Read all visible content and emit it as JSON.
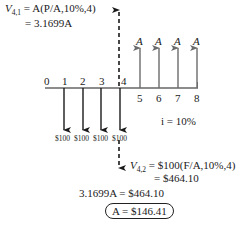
{
  "diagram": {
    "type": "cash-flow-diagram",
    "interest_rate_label": "i = 10%",
    "timeline": {
      "ticks": [
        "0",
        "1",
        "2",
        "3",
        "4",
        "5",
        "6",
        "7",
        "8"
      ]
    },
    "outflows": [
      {
        "period": "1",
        "label": "$100"
      },
      {
        "period": "2",
        "label": "$100"
      },
      {
        "period": "3",
        "label": "$100"
      },
      {
        "period": "4",
        "label": "$100"
      }
    ],
    "inflows": [
      {
        "period": "5",
        "label": "A"
      },
      {
        "period": "6",
        "label": "A"
      },
      {
        "period": "7",
        "label": "A"
      },
      {
        "period": "8",
        "label": "A"
      }
    ],
    "equations": {
      "v41_line1": "V4,1 = A(P/A,10%,4)",
      "v41_lhs": "V",
      "v41_sub": "4,1",
      "v41_rhs": " = A(P/A,10%,4)",
      "v41_line2": "= 3.1699A",
      "v42_lhs": "V",
      "v42_sub": "4,2",
      "v42_rhs": " = $100(F/A,10%,4)",
      "v42_line2": "= $464.10",
      "equate": "3.1699A = $464.10",
      "result": "A = $146.41"
    },
    "colors": {
      "ink": "#1a1a1a",
      "inflow_arrow": "#6b6b6b",
      "outflow_arrow": "#1a1a1a"
    }
  }
}
